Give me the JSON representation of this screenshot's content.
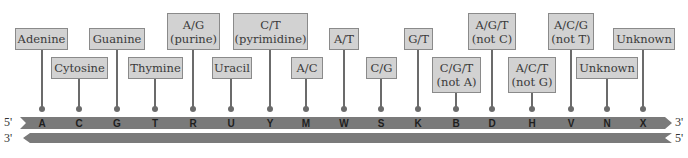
{
  "strands": {
    "top": {
      "left_end": "5'",
      "right_end": "3'"
    },
    "bottom": {
      "left_end": "3'",
      "right_end": "5'"
    },
    "color": "#7a7a7a"
  },
  "codes": [
    {
      "code": "A",
      "label": "Adenine",
      "x": 42,
      "box": {
        "x": 15,
        "y": 28,
        "w": 53,
        "h": 22
      }
    },
    {
      "code": "C",
      "label": "Cytosine",
      "x": 79,
      "box": {
        "x": 51,
        "y": 57,
        "w": 57,
        "h": 22
      }
    },
    {
      "code": "G",
      "label": "Guanine",
      "x": 117,
      "box": {
        "x": 89,
        "y": 28,
        "w": 56,
        "h": 22
      }
    },
    {
      "code": "T",
      "label": "Thymine",
      "x": 155,
      "box": {
        "x": 128,
        "y": 57,
        "w": 55,
        "h": 22
      }
    },
    {
      "code": "R",
      "label": "A/G\n(purine)",
      "x": 193,
      "box": {
        "x": 167,
        "y": 13,
        "w": 53,
        "h": 37
      }
    },
    {
      "code": "U",
      "label": "Uracil",
      "x": 231,
      "box": {
        "x": 212,
        "y": 57,
        "w": 40,
        "h": 22
      }
    },
    {
      "code": "Y",
      "label": "C/T\n(pyrimidine)",
      "x": 270,
      "box": {
        "x": 233,
        "y": 13,
        "w": 75,
        "h": 37
      }
    },
    {
      "code": "M",
      "label": "A/C",
      "x": 306,
      "box": {
        "x": 291,
        "y": 57,
        "w": 32,
        "h": 22
      }
    },
    {
      "code": "W",
      "label": "A/T",
      "x": 344,
      "box": {
        "x": 329,
        "y": 28,
        "w": 30,
        "h": 22
      }
    },
    {
      "code": "S",
      "label": "C/G",
      "x": 381,
      "box": {
        "x": 366,
        "y": 57,
        "w": 31,
        "h": 22
      }
    },
    {
      "code": "K",
      "label": "G/T",
      "x": 418,
      "box": {
        "x": 404,
        "y": 28,
        "w": 29,
        "h": 22
      }
    },
    {
      "code": "B",
      "label": "C/G/T\n(not A)",
      "x": 456,
      "box": {
        "x": 432,
        "y": 57,
        "w": 49,
        "h": 36
      }
    },
    {
      "code": "D",
      "label": "A/G/T\n(not C)",
      "x": 492,
      "box": {
        "x": 468,
        "y": 13,
        "w": 48,
        "h": 37
      }
    },
    {
      "code": "H",
      "label": "A/C/T\n(not G)",
      "x": 532,
      "box": {
        "x": 508,
        "y": 57,
        "w": 48,
        "h": 36
      }
    },
    {
      "code": "V",
      "label": "A/C/G\n(not T)",
      "x": 571,
      "box": {
        "x": 548,
        "y": 13,
        "w": 46,
        "h": 37
      }
    },
    {
      "code": "N",
      "label": "Unknown",
      "x": 607,
      "box": {
        "x": 576,
        "y": 57,
        "w": 62,
        "h": 22
      }
    },
    {
      "code": "X",
      "label": "Unknown",
      "x": 643,
      "box": {
        "x": 613,
        "y": 28,
        "w": 62,
        "h": 22
      }
    }
  ]
}
